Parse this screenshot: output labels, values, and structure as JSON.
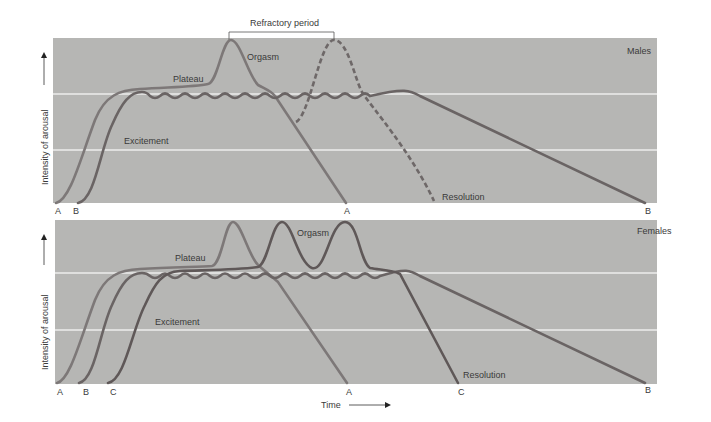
{
  "figure": {
    "top_panel": {
      "title": "Males",
      "y_axis_label": "Intensity of arousal",
      "bracket_label": "Refractory period",
      "phase_labels": {
        "excitement": "Excitement",
        "plateau": "Plateau",
        "orgasm": "Orgasm",
        "resolution": "Resolution"
      },
      "start_labels": [
        "A",
        "B"
      ],
      "end_labels": [
        "A",
        "B"
      ]
    },
    "bottom_panel": {
      "title": "Females",
      "y_axis_label": "Intensity of arousal",
      "phase_labels": {
        "excitement": "Excitement",
        "plateau": "Plateau",
        "orgasm": "Orgasm",
        "resolution": "Resolution"
      },
      "start_labels": [
        "A",
        "B",
        "C"
      ],
      "end_labels": [
        "A",
        "C",
        "B"
      ]
    },
    "x_axis_label": "Time",
    "colors": {
      "panel_bg": "#b6b6b4",
      "gridline": "#ececec",
      "curve_A": "#7d7878",
      "curve_B": "#6a6464",
      "curve_C": "#5f5858",
      "text": "#3a3a3a"
    }
  }
}
